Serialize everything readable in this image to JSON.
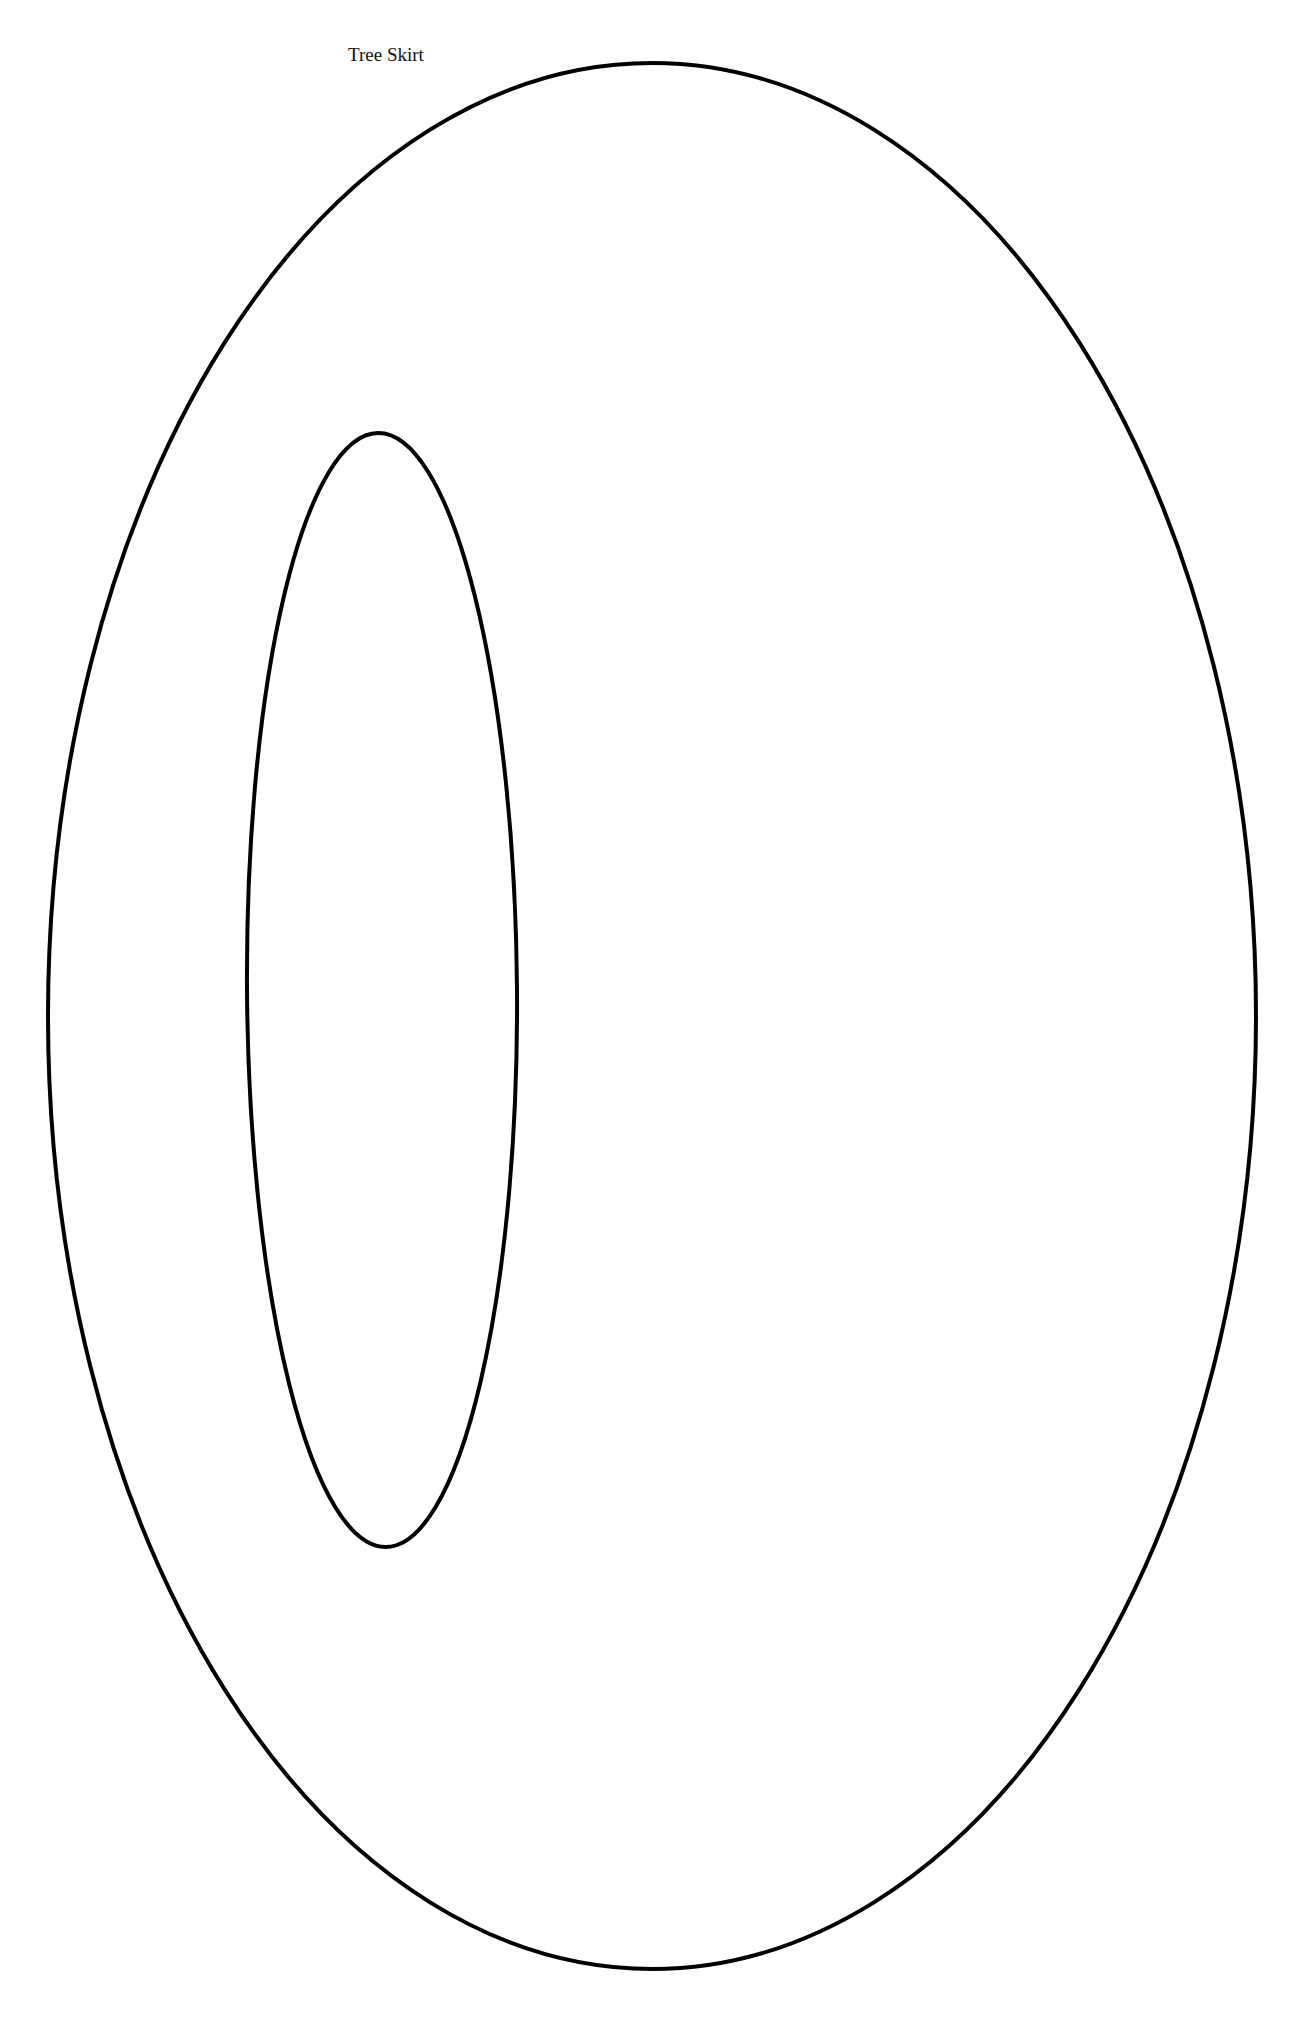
{
  "page": {
    "title": "Tree Skirt",
    "background": "#ffffff",
    "line_color": "#000000"
  },
  "shapes": {
    "outer_ellipse": {
      "cx": 652,
      "cy": 1016,
      "rx": 604,
      "ry": 953,
      "stroke_width": 4
    },
    "inner_ellipse": {
      "cx": 382,
      "cy": 990,
      "rx": 135,
      "ry": 557,
      "stroke_width": 4,
      "rotation_deg": -0.4
    }
  }
}
